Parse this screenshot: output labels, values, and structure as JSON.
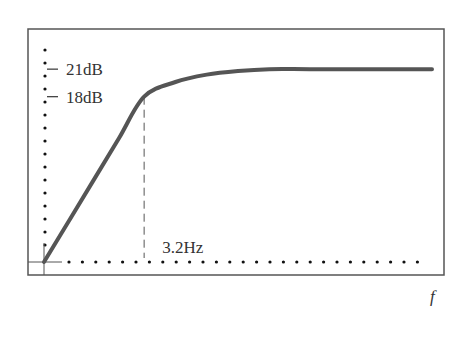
{
  "chart_data": {
    "type": "line",
    "title": "",
    "xlabel": "f",
    "ylabel": "",
    "y_tick_labels": [
      "21dB",
      "18dB"
    ],
    "y_ticks": [
      21,
      18
    ],
    "x_annotation": "3.2Hz",
    "x_marker": 3.2,
    "series": [
      {
        "name": "gain",
        "x": [
          0,
          0.8,
          1.6,
          2.4,
          3.2,
          4.2,
          5.2,
          6.2,
          7.2,
          8.5,
          10.5,
          12.4
        ],
        "y": [
          0,
          4.5,
          9,
          13.5,
          18,
          19.6,
          20.4,
          20.8,
          21,
          21,
          21,
          21
        ]
      }
    ],
    "xlim": [
      0,
      12.4
    ],
    "ylim": [
      0,
      24.5
    ],
    "grid": false
  },
  "colors": {
    "curve": "#555555",
    "frame": "#555555",
    "dots": "#111111"
  }
}
